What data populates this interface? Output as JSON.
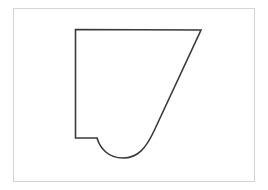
{
  "diagram": {
    "frame": {
      "x": 13,
      "y": 8,
      "width": 241,
      "height": 173,
      "stroke": "#d4d4d4"
    },
    "shape": {
      "description": "Closed outline: vertical left edge, horizontal top edge, long diagonal right edge, rounded bottom lobe, small horizontal step back to left edge",
      "path": "M75.5,29.5 L201,30 L154,131 C146,148 138,158 123,158 C108,158 100,148 97,138 L75.5,138 Z",
      "stroke": "#3a3a3a",
      "stroke_width": 1.6,
      "fill": "none"
    }
  }
}
